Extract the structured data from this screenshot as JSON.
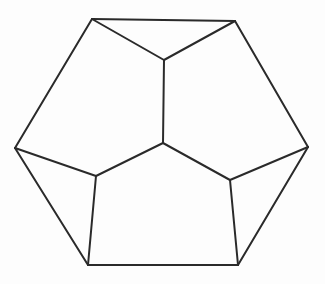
{
  "diagram": {
    "type": "polyhedron-projection",
    "stroke_color": "#2a2a2a",
    "background_color": "#fdfdfd",
    "vertices": {
      "A": [
        92,
        19
      ],
      "B": [
        235,
        21
      ],
      "C": [
        164,
        60
      ],
      "D": [
        15,
        148
      ],
      "E": [
        308,
        147
      ],
      "F": [
        163,
        143
      ],
      "G": [
        96,
        176
      ],
      "H": [
        230,
        180
      ],
      "I": [
        88,
        265
      ],
      "J": [
        238,
        265
      ]
    },
    "edges": [
      [
        "A",
        "B"
      ],
      [
        "A",
        "C"
      ],
      [
        "B",
        "C"
      ],
      [
        "C",
        "F"
      ],
      [
        "A",
        "D"
      ],
      [
        "B",
        "E"
      ],
      [
        "D",
        "G"
      ],
      [
        "E",
        "H"
      ],
      [
        "F",
        "G"
      ],
      [
        "F",
        "H"
      ],
      [
        "D",
        "I"
      ],
      [
        "E",
        "J"
      ],
      [
        "G",
        "I"
      ],
      [
        "H",
        "J"
      ],
      [
        "I",
        "J"
      ]
    ]
  }
}
